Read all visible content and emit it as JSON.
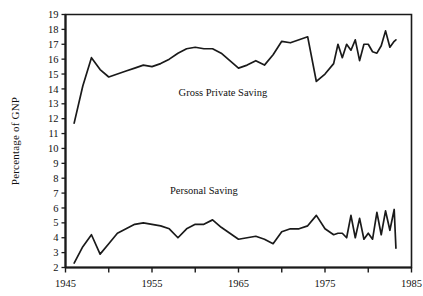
{
  "chart_data": {
    "type": "line",
    "title": "",
    "xlabel": "",
    "ylabel": "Percentage of GNP",
    "xlim": [
      1945,
      1985
    ],
    "ylim": [
      2,
      19
    ],
    "grid": false,
    "legend_position": "inline-annotation",
    "x_major_ticks": [
      1945,
      1955,
      1965,
      1975,
      1985
    ],
    "x_major_tick_labels": [
      "1945",
      "1955",
      "1965",
      "1975",
      "1985"
    ],
    "x_minor_ticks": [
      1950,
      1960,
      1970,
      1980
    ],
    "y_ticks": [
      2,
      3,
      4,
      5,
      6,
      7,
      8,
      9,
      10,
      11,
      12,
      13,
      14,
      15,
      16,
      17,
      18,
      19
    ],
    "y_tick_labels": [
      "2",
      "3",
      "4",
      "5",
      "6",
      "7",
      "8",
      "9",
      "10",
      "11",
      "12",
      "13",
      "14",
      "15",
      "16",
      "17",
      "18",
      "19"
    ],
    "x": [
      1946,
      1947,
      1948,
      1949,
      1950,
      1951,
      1952,
      1953,
      1954,
      1955,
      1956,
      1957,
      1958,
      1959,
      1960,
      1961,
      1962,
      1963,
      1964,
      1965,
      1966,
      1967,
      1968,
      1969,
      1970,
      1971,
      1972,
      1973,
      1974,
      1975,
      1976,
      1977,
      1978,
      1979,
      1980,
      1981,
      1982,
      1983
    ],
    "series": [
      {
        "name": "Gross Private Saving",
        "label_x": 1963.2,
        "label_y": 13.5,
        "color": "#1a1a1a",
        "values": [
          11.7,
          14.2,
          16.1,
          15.3,
          14.8,
          15.0,
          15.2,
          15.4,
          15.6,
          15.5,
          15.7,
          16.0,
          16.4,
          16.7,
          16.8,
          16.7,
          16.7,
          16.4,
          15.9,
          15.4,
          15.6,
          15.9,
          15.6,
          16.3,
          17.2,
          17.1,
          17.3,
          17.5,
          14.5,
          15.0,
          15.7,
          16.1,
          16.6,
          15.9,
          17.0,
          16.4,
          17.9,
          17.2
        ]
      },
      {
        "name": "Personal Saving",
        "label_x": 1961.0,
        "label_y": 6.95,
        "color": "#1a1a1a",
        "values": [
          2.3,
          3.4,
          4.2,
          2.9,
          3.6,
          4.3,
          4.6,
          4.9,
          5.0,
          4.9,
          4.8,
          4.6,
          4.0,
          4.6,
          4.9,
          4.9,
          5.2,
          4.7,
          4.3,
          3.9,
          4.0,
          4.1,
          3.9,
          3.6,
          4.4,
          4.6,
          4.6,
          4.8,
          5.5,
          4.6,
          4.2,
          4.3,
          5.5,
          5.3,
          4.3,
          5.7,
          5.8,
          5.9
        ]
      }
    ],
    "series_extra_points": {
      "Gross Private Saving": {
        "x_tail": [
          1976.5,
          1977.5,
          1978.5,
          1979.5,
          1980.5,
          1981.5,
          1982.5,
          1983.2
        ],
        "y_tail": [
          17.0,
          17.0,
          17.3,
          17.0,
          16.5,
          16.9,
          16.8,
          17.3
        ]
      },
      "Personal Saving": {
        "x_tail": [
          1976.5,
          1977.5,
          1978.5,
          1979.5,
          1980.5,
          1981.5,
          1982.5,
          1983.2
        ],
        "y_tail": [
          4.3,
          4.0,
          4.0,
          3.9,
          3.9,
          4.2,
          4.5,
          3.3
        ]
      }
    }
  },
  "axis": {
    "y_title": "Percentage of GNP"
  },
  "annotations": [
    {
      "name": "gross-private-saving-label",
      "text": "Gross Private Saving"
    },
    {
      "name": "personal-saving-label",
      "text": "Personal Saving"
    }
  ],
  "style": {
    "line_color": "#1a1a1a",
    "axis_color": "#1a1a1a",
    "background": "#ffffff"
  }
}
